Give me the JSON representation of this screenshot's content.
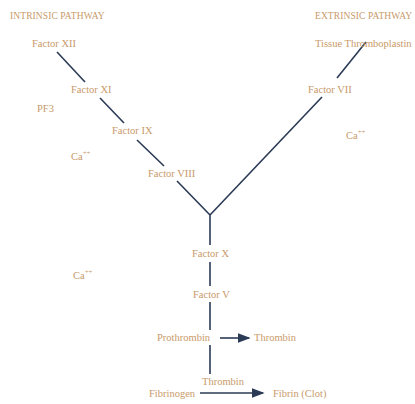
{
  "diagram": {
    "title_intrinsic": "INTRINSIC PATHWAY",
    "title_extrinsic": "EXTRINSIC PATHWAY",
    "intrinsic": {
      "factor_xii": "Factor XII",
      "factor_xi": "Factor XI",
      "pf3": "PF3",
      "factor_ix": "Factor IX",
      "ca1_base": "Ca",
      "ca1_sup": "++",
      "factor_viii": "Factor VIII"
    },
    "extrinsic": {
      "tissue_thromboplastin": "Tissue Thromboplastin",
      "factor_vii": "Factor VII",
      "ca_base": "Ca",
      "ca_sup": "++"
    },
    "common": {
      "factor_x": "Factor X",
      "ca_base": "Ca",
      "ca_sup": "++",
      "factor_v": "Factor V",
      "prothrombin": "Prothrombin",
      "thrombin_product": "Thrombin",
      "thrombin_catalyst": "Thrombin",
      "fibrinogen": "Fibrinogen",
      "fibrin": "Fibrin (Clot)"
    },
    "colors": {
      "text": "#c89a6a",
      "lines": "#2b3a55"
    }
  }
}
